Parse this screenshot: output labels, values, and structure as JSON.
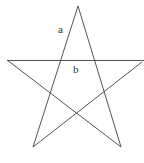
{
  "diagram": {
    "type": "pentagram",
    "stroke_color": "#555555",
    "background": "#ffffff",
    "vertices": {
      "top": [
        78,
        6
      ],
      "left": [
        7,
        60
      ],
      "right": [
        144,
        60
      ],
      "bottom_left": [
        33,
        147
      ],
      "bottom_right": [
        121,
        147
      ]
    },
    "labels": {
      "a": {
        "text": "a",
        "x": 58,
        "y": 33
      },
      "b": {
        "text": "b",
        "x": 73,
        "y": 73
      }
    }
  }
}
